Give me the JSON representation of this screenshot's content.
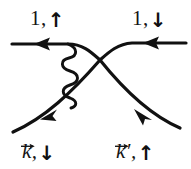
{
  "figure": {
    "kind": "feynman-diagram",
    "width": 191,
    "height": 169,
    "background_color": "#ffffff",
    "ink_color": "#111111"
  },
  "labels": {
    "top_left": {
      "text": "1,",
      "spin": "↑",
      "spin_name": "spin-up-arrow"
    },
    "top_right": {
      "text": "1,",
      "spin": "↓",
      "spin_name": "spin-down-arrow"
    },
    "bottom_left": {
      "k": "k",
      "comma": ",",
      "spin": "↓",
      "spin_name": "spin-down-arrow"
    },
    "bottom_right": {
      "k": "k",
      "prime": "′",
      "comma": ",",
      "spin": "↑",
      "spin_name": "spin-up-arrow"
    }
  },
  "lines": {
    "incoming_top": {
      "name": "incoming-particle-1-line",
      "arrow": "right"
    },
    "outgoing_top": {
      "name": "outgoing-particle-1-line",
      "arrow": "right"
    },
    "incoming_bottom": {
      "name": "incoming-particle-k-line",
      "arrow": "up-right"
    },
    "outgoing_bottom": {
      "name": "outgoing-particle-k-prime-line",
      "arrow": "down-right"
    },
    "interaction": {
      "name": "photon-wavy-line",
      "style": "wavy"
    }
  }
}
